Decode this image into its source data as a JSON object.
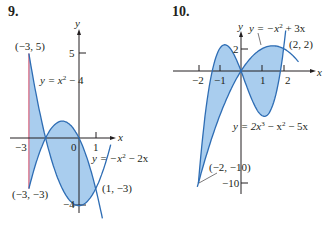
{
  "chart_data": [
    {
      "type": "area",
      "problem_number": "9.",
      "title": "",
      "xlabel": "x",
      "ylabel": "y",
      "x_ticks": [
        -3,
        0,
        1
      ],
      "y_ticks": [
        5,
        -4
      ],
      "curves": [
        {
          "name": "y = x^2 - 4",
          "label": "y = x² − 4",
          "formula": "x^2-4",
          "x_range": [
            -3,
            1.9
          ]
        },
        {
          "name": "y = -x^2 - 2x",
          "label": "y = −x² − 2x",
          "formula": "-x^2-2x",
          "x_range": [
            -3,
            1.4
          ]
        }
      ],
      "vertical_line": {
        "x": -3,
        "from_y": -3,
        "to_y": 5,
        "color": "#d9627a"
      },
      "shaded_region": {
        "x_range": [
          -3,
          1
        ],
        "between": [
          "x^2-4",
          "-x^2-2x"
        ],
        "color": "#a9cdee"
      },
      "annotations": [
        {
          "text": "(−3, 5)",
          "x": -3,
          "y": 5
        },
        {
          "text": "(−3, −3)",
          "x": -3,
          "y": -3
        },
        {
          "text": "(1, −3)",
          "x": 1,
          "y": -3
        }
      ]
    },
    {
      "type": "area",
      "problem_number": "10.",
      "title": "",
      "xlabel": "x",
      "ylabel": "y",
      "x_ticks": [
        -2,
        -1,
        1,
        2
      ],
      "y_ticks": [
        2,
        -10
      ],
      "curves": [
        {
          "name": "y = -x^2 + 3x",
          "label": "y = −x² + 3x",
          "formula": "-x^2+3x",
          "x_range": [
            0,
            2.7
          ]
        },
        {
          "name": "y = 2x^3 - x^2 - 5x",
          "label": "y = 2x³ − x² − 5x",
          "formula": "2x^3-x^2-5x",
          "x_range": [
            -2,
            2.1
          ]
        }
      ],
      "shaded_region": {
        "x_range": [
          -2,
          2
        ],
        "between": [
          "-x^2+3x",
          "2x^3-x^2-5x"
        ],
        "color": "#a9cdee"
      },
      "annotations": [
        {
          "text": "(2, 2)",
          "x": 2,
          "y": 2
        },
        {
          "text": "(−2, −10)",
          "x": -2,
          "y": -10
        }
      ]
    }
  ],
  "labels": {
    "p9": "9.",
    "p10": "10.",
    "p9_curve1": "y = x",
    "p9_curve1_tail": " − 4",
    "p9_curve2": "y = −x",
    "p9_curve2_tail": " − 2x",
    "p9_pt1": "(−3, 5)",
    "p9_pt2": "(−3, −3)",
    "p9_pt3": "(1, −3)",
    "p9_tick_m3": "−3",
    "p9_tick_0": "0",
    "p9_tick_1": "1",
    "p9_tick_5": "5",
    "p9_tick_m4": "−4",
    "p10_curve1": "y = −x",
    "p10_curve1_tail": " + 3x",
    "p10_curve2": "y = 2x",
    "p10_curve2_mid": " − x",
    "p10_curve2_tail": " − 5x",
    "p10_pt1": "(2, 2)",
    "p10_pt2": "(−2, −10)",
    "p10_tick_m2": "−2",
    "p10_tick_m1": "−1",
    "p10_tick_1": "1",
    "p10_tick_2": "2",
    "p10_tick_y2": "2",
    "p10_tick_m10": "−10",
    "sup2": "2",
    "sup3": "3",
    "axis_x": "x",
    "axis_y": "y"
  }
}
